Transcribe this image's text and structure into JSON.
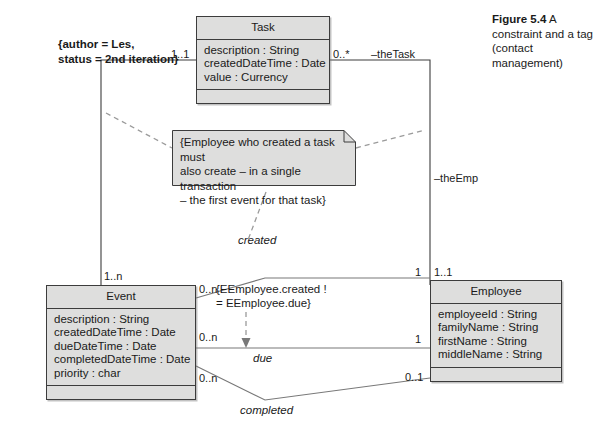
{
  "figure": {
    "label": "Figure 5.4",
    "caption": "A constraint and a tag (contact management)"
  },
  "tag_note": {
    "text": "{author = Les,\nstatus = 2nd iteration}"
  },
  "constraint_note": {
    "text": "{Employee who created a task must\nalso create – in a single transaction\n– the first event for that task}"
  },
  "inline_constraint": {
    "text": "{EEmployee.created !\n= EEmployee.due}"
  },
  "classes": [
    {
      "name": "Task",
      "attributes": [
        "description : String",
        "createdDateTime : Date",
        "value : Currency"
      ],
      "operations": []
    },
    {
      "name": "Event",
      "attributes": [
        "description : String",
        "createdDateTime : Date",
        "dueDateTime : Date",
        "completedDateTime : Date",
        "priority : char"
      ],
      "operations": []
    },
    {
      "name": "Employee",
      "attributes": [
        "employeeId : String",
        "familyName : String",
        "firstName : String",
        "middleName : String"
      ],
      "operations": []
    }
  ],
  "associations": {
    "task_event": {
      "task_end_multiplicity": "1..1",
      "event_end_multiplicity": "1..n"
    },
    "task_employee": {
      "task_end_multiplicity": "0..*",
      "task_end_role": "–theTask",
      "employee_end_role": "–theEmp",
      "employee_end_multiplicity": "1..1"
    },
    "created": {
      "name": "created",
      "event_multiplicity": "0..n",
      "employee_multiplicity": "1"
    },
    "due": {
      "name": "due",
      "event_multiplicity": "0..n",
      "employee_multiplicity": "1"
    },
    "completed": {
      "name": "completed",
      "event_multiplicity": "0..n",
      "employee_multiplicity": "0..1"
    }
  },
  "colors": {
    "box_fill": "#dededd",
    "line": "#3c3c3c",
    "text": "#1a1a1a"
  }
}
